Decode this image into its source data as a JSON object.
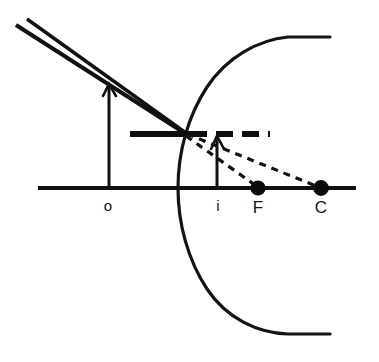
{
  "diagram": {
    "type": "optics-ray-diagram",
    "canvas": {
      "width": 379,
      "height": 362,
      "background": "#ffffff"
    },
    "stroke_color": "#111111",
    "principal_axis": {
      "label": "principal-axis",
      "x1": 38,
      "x2": 356,
      "y": 188
    },
    "mirror": {
      "label": "concave-mirror-arc",
      "vertex": {
        "x": 178,
        "y": 188
      },
      "top_end": {
        "x": 330,
        "y": 37
      },
      "bottom_end": {
        "x": 330,
        "y": 334
      }
    },
    "labels": [
      {
        "name": "object-point-label",
        "text": "o",
        "x": 108,
        "y": 208
      },
      {
        "name": "image-point-label",
        "text": "i",
        "x": 218,
        "y": 208
      },
      {
        "name": "focal-point-label",
        "text": "F",
        "x": 258,
        "y": 210
      },
      {
        "name": "center-curvature-label",
        "text": "C",
        "x": 321,
        "y": 210
      }
    ],
    "points": [
      {
        "name": "focal-point-dot",
        "label": "F",
        "x": 258,
        "y": 188,
        "r": 7.5
      },
      {
        "name": "center-curvature-dot",
        "label": "C",
        "x": 321,
        "y": 188,
        "r": 7.8
      }
    ],
    "object": {
      "name": "object-arrow",
      "base": {
        "x": 109,
        "y": 188
      },
      "tip": {
        "x": 109,
        "y": 84
      },
      "label": "o"
    },
    "image": {
      "name": "image-arrow",
      "base": {
        "x": 217,
        "y": 188
      },
      "tip": {
        "x": 217,
        "y": 136
      },
      "label": "i"
    },
    "image_bar": {
      "name": "virtual-image-bar",
      "y": 134,
      "solid_x1": 130,
      "solid_x2": 188,
      "dashed_x1": 188,
      "dashed_x2": 270
    },
    "rays": [
      {
        "name": "incident-ray-upper",
        "x1": 16,
        "y1": 24,
        "x2": 185,
        "y2": 133,
        "style": "solid"
      },
      {
        "name": "incident-ray-lower",
        "x1": 26,
        "y1": 19,
        "x2": 185,
        "y2": 133,
        "style": "solid"
      },
      {
        "name": "reflected-ray-to-focus",
        "x1": 185,
        "y1": 134,
        "x2": 262,
        "y2": 190,
        "style": "dashed"
      },
      {
        "name": "reflected-ray-to-center",
        "x1": 185,
        "y1": 134,
        "x2": 324,
        "y2": 190,
        "style": "dashed"
      }
    ],
    "notes": {
      "object_distance_label": "o",
      "image_distance_label": "i",
      "focus_label": "F",
      "center_label": "C"
    }
  }
}
